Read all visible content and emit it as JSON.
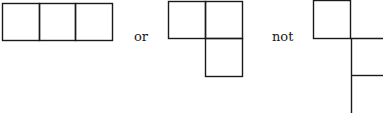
{
  "figures": [
    {
      "name": "straight-tromino",
      "description": "three squares in a row"
    },
    {
      "name": "l-tromino",
      "description": "two squares on top, one below the right square"
    },
    {
      "name": "disallowed-arrangement",
      "description": "squares joined only at a corner (cut off at right edge)"
    }
  ],
  "connectors": {
    "or": "or",
    "not": "not"
  },
  "colors": {
    "stroke": "#1a1a1a",
    "background": "#ffffff"
  }
}
